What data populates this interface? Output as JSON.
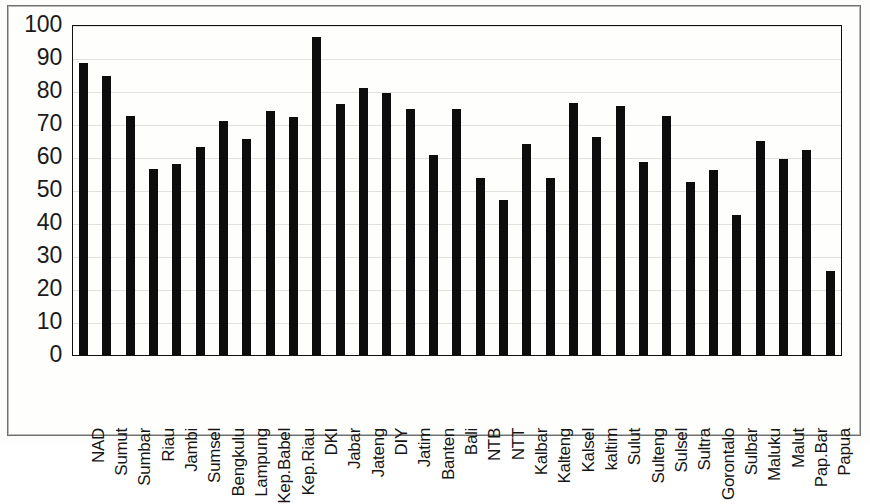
{
  "chart_data": {
    "type": "bar",
    "title": "",
    "subtitle": "",
    "xlabel": "",
    "ylabel": "",
    "ylim": [
      0,
      100
    ],
    "yticks": [
      100,
      90,
      80,
      70,
      60,
      50,
      40,
      30,
      20,
      10,
      0
    ],
    "grid": true,
    "legend": "none",
    "bar_color": "#0d0d0d",
    "categories": [
      "NAD",
      "Sumut",
      "Sumbar",
      "Riau",
      "Jambi",
      "Sumsel",
      "Bengkulu",
      "Lampung",
      "Kep.Babel",
      "Kep.Riau",
      "DKI",
      "Jabar",
      "Jateng",
      "DIY",
      "Jatim",
      "Banten",
      "Bali",
      "NTB",
      "NTT",
      "Kalbar",
      "Kalteng",
      "Kalsel",
      "kaltim",
      "Sulut",
      "Sulteng",
      "Sulsel",
      "Sultra",
      "Gorontalo",
      "Sulbar",
      "Maluku",
      "Malut",
      "Pap.Bar",
      "Papua"
    ],
    "values": [
      88.5,
      84.5,
      72.5,
      56.5,
      58.0,
      63.0,
      71.0,
      65.5,
      74.0,
      72.0,
      96.5,
      76.0,
      81.0,
      79.5,
      74.5,
      60.5,
      74.5,
      53.5,
      47.0,
      64.0,
      53.5,
      76.5,
      66.0,
      75.5,
      58.5,
      72.5,
      52.5,
      56.0,
      42.5,
      65.0,
      59.5,
      62.0,
      25.5
    ]
  }
}
